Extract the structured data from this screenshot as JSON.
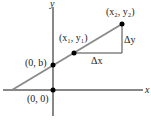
{
  "diagram": {
    "axes": {
      "x_label": "x",
      "y_label": "y"
    },
    "points": [
      {
        "id": "origin",
        "label": "(0, 0)"
      },
      {
        "id": "intercept",
        "label": "(0, b)"
      },
      {
        "id": "p1",
        "label": "(x₁, y₁)"
      },
      {
        "id": "p2",
        "label": "(x₂, y₂)"
      }
    ],
    "deltas": {
      "dx_label": "Δx",
      "dy_label": "Δy"
    },
    "colors": {
      "line": "#8c8c8c",
      "axes": "#111111",
      "points": "#000000"
    }
  }
}
